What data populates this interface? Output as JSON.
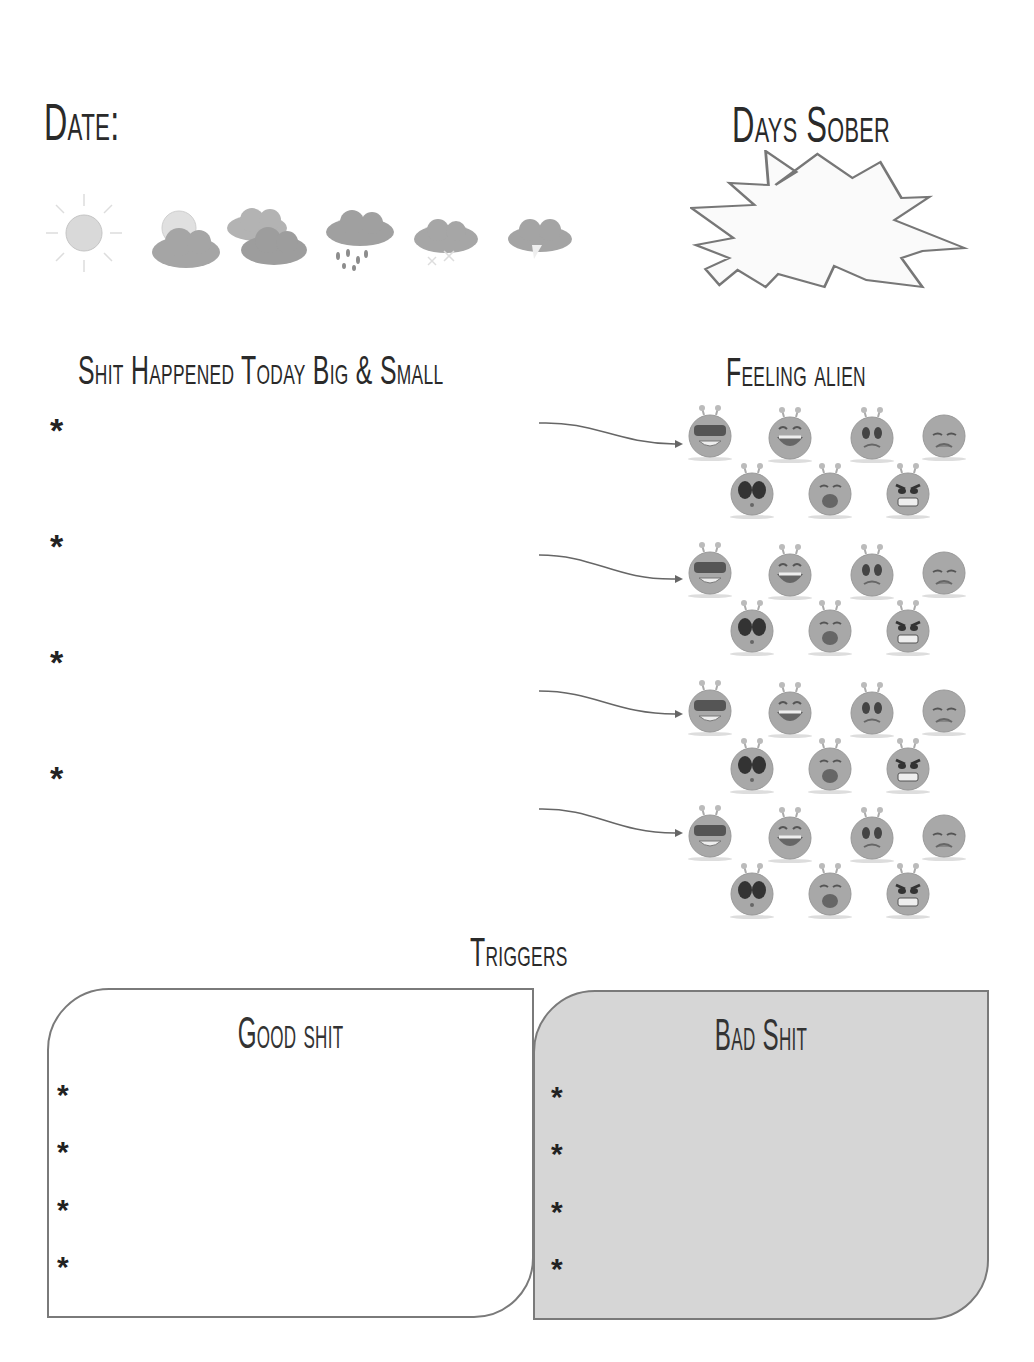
{
  "header": {
    "date_label": "Date:",
    "days_sober_label": "Days Sober",
    "days_sober_value": ""
  },
  "weather": {
    "icons": [
      "sunny-icon",
      "partly-cloudy-icon",
      "cloudy-icon",
      "rain-icon",
      "snow-icon",
      "thunderstorm-icon"
    ]
  },
  "events": {
    "title": "Shit Happened Today Big & Small",
    "bullet": "*",
    "items": [
      "",
      "",
      "",
      ""
    ]
  },
  "feelings": {
    "title": "Feeling alien",
    "moods": [
      "cool-alien",
      "laughing-alien",
      "worried-alien",
      "sad-alien",
      "shocked-alien",
      "crying-alien",
      "angry-alien"
    ]
  },
  "triggers": {
    "title": "Triggers",
    "good": {
      "title": "Good shit",
      "bullet": "*",
      "items": [
        "",
        "",
        "",
        ""
      ]
    },
    "bad": {
      "title": "Bad Shit",
      "bullet": "*",
      "items": [
        "",
        "",
        "",
        ""
      ]
    }
  },
  "colors": {
    "text": "#2a2a2a",
    "box_border": "#7a7a7a",
    "bad_box_fill": "#d6d6d6",
    "icon_gray": "#a8a8a8"
  }
}
